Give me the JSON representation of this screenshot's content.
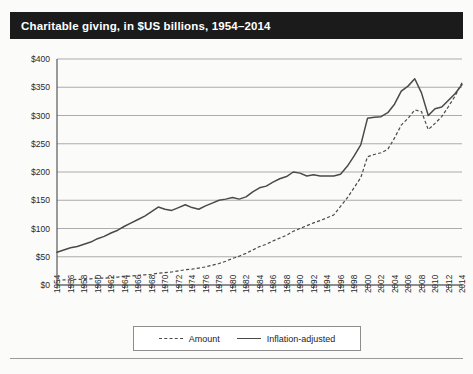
{
  "header": {
    "title": "Charitable giving, in $US billions, 1954–2014"
  },
  "legend": {
    "items": [
      {
        "label": "Amount",
        "style": "dashed"
      },
      {
        "label": "Inflation-adjusted",
        "style": "solid"
      }
    ]
  },
  "chart_data": {
    "type": "line",
    "title": "Charitable giving, in $US billions, 1954–2014",
    "xlabel": "",
    "ylabel": "",
    "ylim": [
      0,
      400
    ],
    "ytick_labels": [
      "$0",
      "$50",
      "$100",
      "$150",
      "$200",
      "$250",
      "$300",
      "$350",
      "$400"
    ],
    "ytick_values": [
      0,
      50,
      100,
      150,
      200,
      250,
      300,
      350,
      400
    ],
    "grid": true,
    "legend_position": "bottom",
    "xlim": [
      1954,
      2014
    ],
    "xtick_labels": [
      "1954",
      "1956",
      "1958",
      "1960",
      "1962",
      "1964",
      "1966",
      "1968",
      "1970",
      "1972",
      "1974",
      "1976",
      "1978",
      "1980",
      "1982",
      "1984",
      "1986",
      "1988",
      "1990",
      "1992",
      "1994",
      "1996",
      "1998",
      "2000",
      "2002",
      "2004",
      "2006",
      "2008",
      "2010",
      "2012",
      "2014"
    ],
    "xtick_values": [
      1954,
      1956,
      1958,
      1960,
      1962,
      1964,
      1966,
      1968,
      1970,
      1972,
      1974,
      1976,
      1978,
      1980,
      1982,
      1984,
      1986,
      1988,
      1990,
      1992,
      1994,
      1996,
      1998,
      2000,
      2002,
      2004,
      2006,
      2008,
      2010,
      2012,
      2014
    ],
    "x": [
      1954,
      1955,
      1956,
      1957,
      1958,
      1959,
      1960,
      1961,
      1962,
      1963,
      1964,
      1965,
      1966,
      1967,
      1968,
      1969,
      1970,
      1971,
      1972,
      1973,
      1974,
      1975,
      1976,
      1977,
      1978,
      1979,
      1980,
      1981,
      1982,
      1983,
      1984,
      1985,
      1986,
      1987,
      1988,
      1989,
      1990,
      1991,
      1992,
      1993,
      1994,
      1995,
      1996,
      1997,
      1998,
      1999,
      2000,
      2001,
      2002,
      2003,
      2004,
      2005,
      2006,
      2007,
      2008,
      2009,
      2010,
      2011,
      2012,
      2013,
      2014
    ],
    "series": [
      {
        "name": "Amount",
        "style": "dashed",
        "values": [
          8,
          9,
          9,
          10,
          10,
          11,
          12,
          12,
          13,
          14,
          15,
          16,
          17,
          18,
          19,
          21,
          22,
          23,
          25,
          27,
          28,
          30,
          32,
          35,
          38,
          42,
          47,
          51,
          56,
          62,
          68,
          72,
          78,
          83,
          88,
          95,
          100,
          105,
          110,
          114,
          119,
          124,
          139,
          154,
          172,
          190,
          227,
          231,
          234,
          240,
          260,
          283,
          295,
          310,
          307,
          275,
          286,
          298,
          316,
          335,
          358
        ]
      },
      {
        "name": "Inflation-adjusted",
        "style": "solid",
        "values": [
          58,
          62,
          66,
          68,
          72,
          76,
          82,
          86,
          92,
          97,
          104,
          110,
          116,
          122,
          130,
          138,
          134,
          132,
          137,
          142,
          137,
          134,
          140,
          145,
          150,
          152,
          155,
          152,
          156,
          165,
          172,
          175,
          182,
          188,
          192,
          200,
          198,
          193,
          195,
          193,
          193,
          193,
          196,
          210,
          228,
          248,
          295,
          297,
          298,
          305,
          320,
          343,
          352,
          365,
          340,
          300,
          312,
          315,
          327,
          339,
          355
        ]
      }
    ]
  }
}
